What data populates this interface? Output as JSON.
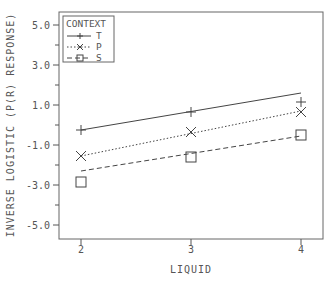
{
  "chart_data": {
    "type": "line",
    "title": "",
    "xlabel": "LIQUID",
    "ylabel": "INVERSE LOGISTIC (P(R) RESPONSE)",
    "xlim": [
      1.8,
      4.2
    ],
    "ylim": [
      -5.7,
      5.7
    ],
    "x_ticks": [
      2,
      3,
      4
    ],
    "x_tick_labels": [
      "2",
      "3",
      "4"
    ],
    "y_major_ticks": [
      5,
      3,
      1,
      -1,
      -3,
      -5
    ],
    "y_tick_labels": [
      "5.0",
      "3.0",
      "1.0",
      "-1.0",
      "-3.0",
      "-5.0"
    ],
    "y_minor_ticks": [
      4,
      2,
      0,
      -2,
      -4
    ],
    "grid": false,
    "legend": {
      "title": "CONTEXT",
      "position": "upper-left"
    },
    "x": [
      2,
      3,
      4
    ],
    "series": [
      {
        "name": "T",
        "marker": "plus",
        "line_style": "solid",
        "observed": [
          -0.25,
          0.65,
          1.15
        ],
        "fitted_line": [
          [
            2,
            -0.25
          ],
          [
            4,
            1.6
          ]
        ]
      },
      {
        "name": "P",
        "marker": "x",
        "line_style": "dotted",
        "observed": [
          -1.55,
          -0.35,
          0.65
        ],
        "fitted_line": [
          [
            2,
            -1.55
          ],
          [
            4,
            0.7
          ]
        ]
      },
      {
        "name": "S",
        "marker": "square",
        "line_style": "dashed",
        "observed": [
          -2.85,
          -1.6,
          -0.5
        ],
        "fitted_line": [
          [
            2,
            -2.3
          ],
          [
            4,
            -0.55
          ]
        ]
      }
    ]
  },
  "colors": {
    "axis": "#555555",
    "line": "#444444",
    "background": "#ffffff"
  }
}
